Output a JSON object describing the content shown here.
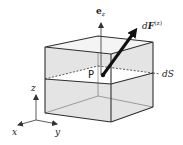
{
  "figure": {
    "type": "3d-box-diagram",
    "colors": {
      "face_fill": "#e4e4e4",
      "cut_plane_fill": "#ffffff",
      "edge": "#3a3a3a",
      "arrow": "#111111",
      "text": "#222222"
    }
  },
  "labels": {
    "normal_vector": {
      "base": "e",
      "sub": "z"
    },
    "force_vector": {
      "base": "dF",
      "sup": "(z)",
      "prefix": "d",
      "symbol": "F"
    },
    "surface_element": "dS",
    "point": "P",
    "axis_x": "x",
    "axis_y": "y",
    "axis_z": "z"
  }
}
